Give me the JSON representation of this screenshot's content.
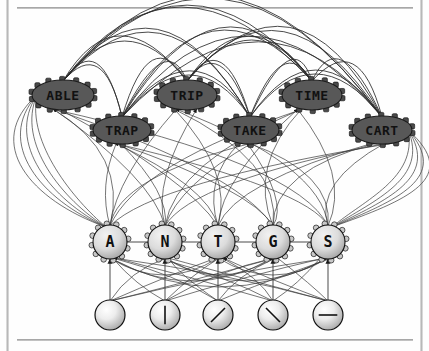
{
  "figure": {
    "type": "node-link-diagram",
    "background_color": "#ffffff",
    "edge_color": "#2a2a2a",
    "frame": {
      "left_rule": "vertical-gray-rule",
      "right_rule": "vertical-gray-rule",
      "top_rule": "horizontal-gray-rule",
      "bottom_rule": "horizontal-gray-rule",
      "rule_color": "#9a9a9a"
    }
  },
  "layers": {
    "word_layer": {
      "name": "word-level",
      "node_shape": "ellipse",
      "fill_color": "#585858",
      "text_color": "#111111",
      "nodes": [
        {
          "id": "able",
          "label": "ABLE",
          "cx": 63,
          "cy": 95,
          "rx": 31,
          "ry": 15
        },
        {
          "id": "trap",
          "label": "TRAP",
          "cx": 122,
          "cy": 130,
          "rx": 29,
          "ry": 14
        },
        {
          "id": "trip",
          "label": "TRIP",
          "cx": 187,
          "cy": 95,
          "rx": 30,
          "ry": 15
        },
        {
          "id": "take",
          "label": "TAKE",
          "cx": 250,
          "cy": 130,
          "rx": 29,
          "ry": 14
        },
        {
          "id": "time",
          "label": "TIME",
          "cx": 312,
          "cy": 95,
          "rx": 30,
          "ry": 15
        },
        {
          "id": "cart",
          "label": "CART",
          "cx": 382,
          "cy": 130,
          "rx": 30,
          "ry": 14
        }
      ]
    },
    "letter_layer": {
      "name": "letter-level",
      "node_shape": "circle",
      "fill_color": "#d4d4d4",
      "text_color": "#111111",
      "nodes": [
        {
          "id": "letter-a",
          "label": "A",
          "cx": 110,
          "cy": 242,
          "r": 17
        },
        {
          "id": "letter-n",
          "label": "N",
          "cx": 165,
          "cy": 242,
          "r": 17
        },
        {
          "id": "letter-t",
          "label": "T",
          "cx": 218,
          "cy": 242,
          "r": 17
        },
        {
          "id": "letter-g",
          "label": "G",
          "cx": 273,
          "cy": 242,
          "r": 17
        },
        {
          "id": "letter-s",
          "label": "S",
          "cx": 328,
          "cy": 242,
          "r": 17
        }
      ]
    },
    "feature_layer": {
      "name": "feature-level",
      "node_shape": "circle",
      "fill_color": "#dcdcdc",
      "stroke_color": "#111111",
      "nodes": [
        {
          "id": "feature-blank",
          "glyph": "blank",
          "cx": 110,
          "cy": 315,
          "r": 15
        },
        {
          "id": "feature-vertical",
          "glyph": "vertical",
          "cx": 165,
          "cy": 315,
          "r": 15
        },
        {
          "id": "feature-slash",
          "glyph": "slash",
          "cx": 218,
          "cy": 315,
          "r": 15
        },
        {
          "id": "feature-backslash",
          "glyph": "backslash",
          "cx": 273,
          "cy": 315,
          "r": 15
        },
        {
          "id": "feature-horizontal",
          "glyph": "horizontal",
          "cx": 328,
          "cy": 315,
          "r": 15
        }
      ]
    }
  }
}
